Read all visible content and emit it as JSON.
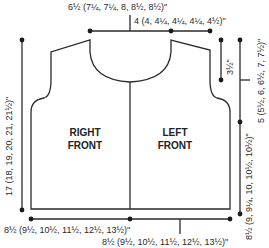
{
  "diagram": {
    "type": "knitting-schematic",
    "pieces": {
      "right_front": "RIGHT\nFRONT",
      "right_front_l1": "RIGHT",
      "right_front_l2": "FRONT",
      "left_front_l1": "LEFT",
      "left_front_l2": "FRONT"
    },
    "measurements": {
      "top_width": "6½ (7¼, 7¼, 8, 8½, 8½)\"",
      "shoulder": "4 (4, 4¼, 4¼, 4¼, 4½)\"",
      "armhole_shaping": "3½\"",
      "armhole_depth": "5 (5½, 6, 6½, 7, 7½)\"",
      "side_length": "8½ (9, 9¼, 10, 10½, 10½)\"",
      "total_length": "17 (18, 19, 20, 21, 21½)\"",
      "bottom_right_front": "8½ (9½, 10½, 11½, 12½, 13½)\"",
      "bottom_left_front": "8½ (9½, 10½, 11½, 12½, 13½)\""
    },
    "colors": {
      "line": "#2a2a2a",
      "background": "#ffffff"
    }
  }
}
